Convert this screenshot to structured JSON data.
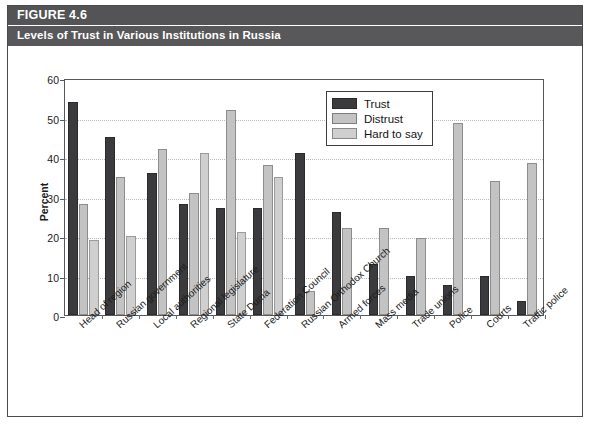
{
  "figure": {
    "number_label": "FIGURE 4.6",
    "subtitle": "Levels of Trust in Various Institutions in Russia"
  },
  "chart_data": {
    "type": "bar",
    "title": "Levels of Trust in Various Institutions in Russia",
    "xlabel": "",
    "ylabel": "Percent",
    "ylim": [
      0,
      60
    ],
    "yticks": [
      0,
      10,
      20,
      30,
      40,
      50,
      60
    ],
    "grid": true,
    "legend_position": "upper center",
    "categories": [
      "Head of region",
      "Russian government",
      "Local authorities",
      "Regional legislature",
      "State Duma",
      "Federation Council",
      "Russian Orthodox Church",
      "Armed forces",
      "Mass media",
      "Trade unions",
      "Police",
      "Courts",
      "Traffic police"
    ],
    "series": [
      {
        "name": "Trust",
        "color": "#3b3b3d",
        "values": [
          54,
          45,
          36,
          28,
          27,
          27,
          41,
          26,
          13,
          10,
          7.5,
          10,
          3.5
        ]
      },
      {
        "name": "Distrust",
        "color": "#c3c3c3",
        "values": [
          28,
          35,
          42,
          31,
          52,
          38,
          6,
          22,
          22,
          19.5,
          48.5,
          34,
          38.5
        ]
      },
      {
        "name": "Hard to say",
        "color": "#cfcfcf",
        "values": [
          19,
          20,
          null,
          41,
          21,
          35,
          null,
          null,
          null,
          null,
          null,
          null,
          null
        ]
      }
    ]
  }
}
